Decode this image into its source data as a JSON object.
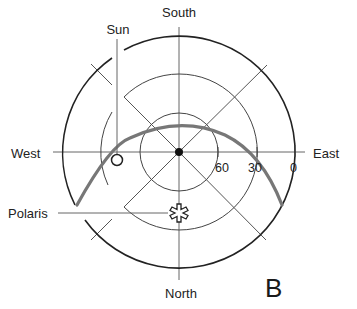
{
  "diagram": {
    "directions": {
      "south": "South",
      "north": "North",
      "east": "East",
      "west": "West"
    },
    "altitude_labels": [
      "60",
      "30",
      "0"
    ],
    "markers": {
      "sun": "Sun",
      "polaris": "Polaris",
      "zenith": "zenith-dot"
    },
    "panel_label": "B",
    "colors": {
      "lines": "#333333",
      "path": "#777777",
      "background": "#ffffff"
    }
  }
}
